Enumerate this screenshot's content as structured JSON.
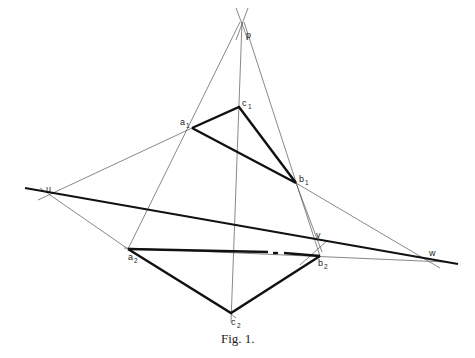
{
  "figure": {
    "caption": "Fig. 1.",
    "points": {
      "p": {
        "label": "p",
        "sub": "",
        "x": 242,
        "y": 35
      },
      "c1": {
        "label": "c",
        "sub": "1",
        "x": 239,
        "y": 107
      },
      "a1": {
        "label": "a",
        "sub": "1",
        "x": 192,
        "y": 128
      },
      "b1": {
        "label": "b",
        "sub": "1",
        "x": 296,
        "y": 183
      },
      "u": {
        "label": "u",
        "sub": "",
        "x": 48,
        "y": 195
      },
      "v": {
        "label": "v",
        "sub": "",
        "x": 318,
        "y": 246
      },
      "w": {
        "label": "w",
        "sub": "",
        "x": 427,
        "y": 260
      },
      "a2": {
        "label": "a",
        "sub": "2",
        "x": 128,
        "y": 249
      },
      "b2": {
        "label": "b",
        "sub": "2",
        "x": 320,
        "y": 256
      },
      "c2": {
        "label": "c",
        "sub": "2",
        "x": 231,
        "y": 313
      }
    },
    "thick_segments": [
      [
        "a1",
        "c1"
      ],
      [
        "c1",
        "b1"
      ],
      [
        "a1",
        "b1"
      ],
      [
        "a2",
        "b2"
      ],
      [
        "b2",
        "c2"
      ],
      [
        "a2",
        "c2"
      ]
    ],
    "axis_line": {
      "from": [
        25,
        188
      ],
      "to": [
        458,
        264
      ]
    },
    "thin_lines": [
      [
        "p",
        "a2"
      ],
      [
        "p",
        "c2"
      ],
      [
        "p",
        "b2"
      ],
      [
        "u",
        "a1"
      ],
      [
        "u",
        "a2"
      ],
      [
        "b1",
        "w"
      ],
      [
        "b2",
        "w"
      ],
      [
        "c1",
        "v"
      ],
      [
        "b1",
        "v"
      ]
    ]
  }
}
